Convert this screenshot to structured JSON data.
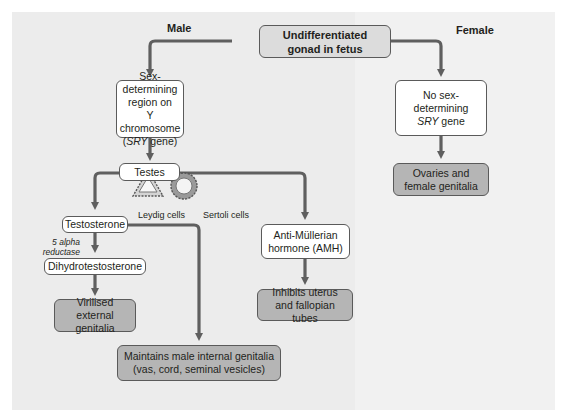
{
  "headings": {
    "male": "Male",
    "female": "Female"
  },
  "nodes": {
    "root": {
      "line1": "Undifferentiated",
      "line2": "gonad in fetus"
    },
    "sry": {
      "line1": "Sex-determining",
      "line2": "region on",
      "line3": "Y chromosome",
      "line4_italic": "SRY",
      "line4_rest": " gene)",
      "line4_open": "("
    },
    "no_sry": {
      "line1": "No sex-",
      "line2": "determining",
      "line3_italic": "SRY",
      "line3_rest": " gene"
    },
    "ovaries": {
      "line1": "Ovaries and",
      "line2": "female genitalia"
    },
    "testes": {
      "label": "Testes"
    },
    "testosterone": {
      "label": "Testosterone"
    },
    "dht": {
      "label": "Dihydrotestosterone"
    },
    "virilised": {
      "line1": "Virilised",
      "line2": "external genitalia"
    },
    "amh": {
      "line1": "Anti-Müllerian",
      "line2": "hormone (AMH)"
    },
    "inhibits": {
      "line1": "Inhibits uterus",
      "line2": "and fallopian tubes"
    },
    "maintains": {
      "line1": "Maintains male internal genitalia",
      "line2": "(vas, cord, seminal vesicles)"
    }
  },
  "cells": {
    "leydig": {
      "label": "Leydig cells",
      "icon": "triangle-cell-icon"
    },
    "sertoli": {
      "label": "Sertoli cells",
      "icon": "ring-cell-icon"
    }
  },
  "enzyme": {
    "line1": "5 alpha",
    "line2": "reductase"
  },
  "colors": {
    "arrow": "#5f5f5f",
    "box_border": "#5a5a5a",
    "box_white": "#ffffff",
    "box_shaded": "#b5b5b5",
    "box_top": "#dcdcdc",
    "panel_left": "#ececec",
    "panel_right": "#f1f1f1"
  }
}
